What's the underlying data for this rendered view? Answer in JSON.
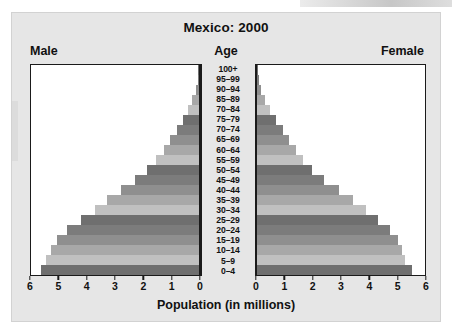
{
  "figure": {
    "title": "Mexico: 2000",
    "left_header": "Male",
    "center_header": "Age",
    "right_header": "Female",
    "x_axis_title": "Population (in millions)"
  },
  "palette": {
    "panel_background": "#e6e6e6",
    "plot_background": "#ffffff",
    "axis_line": "#1a1a1a",
    "text": "#111111",
    "bar_shades": [
      "#6f6f6f",
      "#c0c0c0",
      "#a8a8a8",
      "#8f8f8f",
      "#7c7c7c"
    ]
  },
  "axis": {
    "tick_labels_left": [
      "6",
      "5",
      "4",
      "3",
      "2",
      "1",
      "0"
    ],
    "tick_labels_right": [
      "0",
      "1",
      "2",
      "3",
      "4",
      "5",
      "6"
    ],
    "max": 6,
    "units": "millions"
  },
  "chart_data": {
    "type": "bar",
    "subtype": "population-pyramid",
    "title": "Mexico: 2000",
    "xlabel": "Population (in millions)",
    "ylabel": "Age",
    "xlim": [
      0,
      6
    ],
    "grid": false,
    "legend": "none",
    "categories": [
      "0–4",
      "5–9",
      "10–14",
      "15–19",
      "20–24",
      "25–29",
      "30–34",
      "35–39",
      "40–44",
      "45–49",
      "50–54",
      "55–59",
      "60–64",
      "65–69",
      "70–74",
      "75–79",
      "70–84",
      "85–89",
      "90–94",
      "95–99",
      "100+"
    ],
    "series": [
      {
        "name": "Male",
        "direction": "left",
        "values": [
          5.66,
          5.45,
          5.3,
          5.08,
          4.72,
          4.2,
          3.72,
          3.3,
          2.78,
          2.27,
          1.87,
          1.52,
          1.26,
          1.02,
          0.8,
          0.58,
          0.4,
          0.24,
          0.12,
          0.05,
          0.02
        ]
      },
      {
        "name": "Female",
        "direction": "right",
        "values": [
          5.52,
          5.3,
          5.18,
          5.02,
          4.76,
          4.32,
          3.88,
          3.44,
          2.92,
          2.4,
          1.98,
          1.64,
          1.38,
          1.14,
          0.92,
          0.68,
          0.48,
          0.3,
          0.15,
          0.06,
          0.02
        ]
      }
    ]
  }
}
